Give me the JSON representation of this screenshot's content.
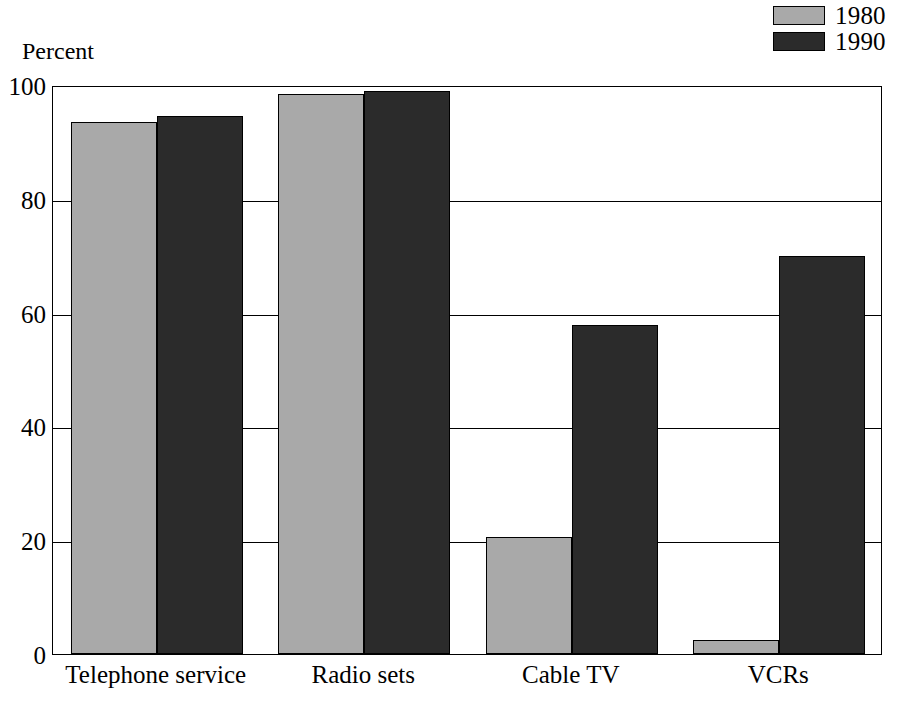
{
  "chart_data": {
    "type": "bar",
    "title": "",
    "subtitle": "",
    "xlabel": "",
    "ylabel": "Percent",
    "ylim": [
      0,
      100
    ],
    "yticks": [
      0,
      20,
      40,
      60,
      80,
      100
    ],
    "ytick_labels": [
      "0",
      "20",
      "40",
      "60",
      "80",
      "100"
    ],
    "grid": "horizontal",
    "legend_position": "top-right",
    "categories": [
      "Telephone service",
      "Radio sets",
      "Cable TV",
      "VCRs"
    ],
    "series": [
      {
        "name": "1980",
        "color": "#a9a9a9",
        "values": [
          93.5,
          98.5,
          20.5,
          2.5
        ]
      },
      {
        "name": "1990",
        "color": "#2b2b2b",
        "values": [
          94.5,
          99.0,
          57.8,
          70.0
        ]
      }
    ]
  },
  "legend": {
    "items": [
      {
        "label": "1980",
        "swatch": "legend-swatch-1980"
      },
      {
        "label": "1990",
        "swatch": "legend-swatch-1990"
      }
    ]
  },
  "axes": {
    "y_title": "Percent"
  }
}
